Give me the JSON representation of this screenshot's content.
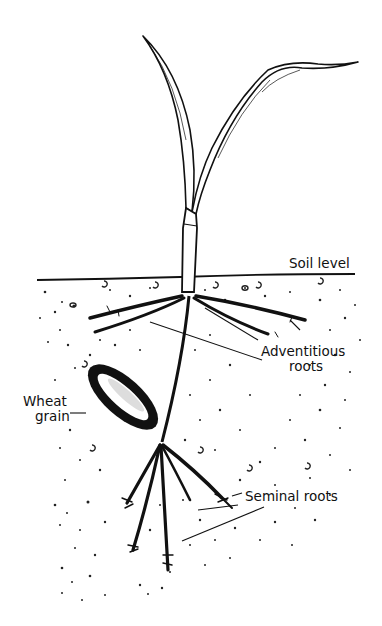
{
  "figure": {
    "colors": {
      "ink": "#111111",
      "background": "#ffffff",
      "caption_faded": "#b8b8b8"
    },
    "labels": {
      "soil_level": "Soil level",
      "adventitious_roots_line1": "Adventitious",
      "adventitious_roots_line2": "roots",
      "wheat_grain_line1": "Wheat",
      "wheat_grain_line2": "grain",
      "seminal_roots": "Seminal roots"
    },
    "caption": {
      "visible": "partially cut off at bottom edge, illegible"
    }
  }
}
